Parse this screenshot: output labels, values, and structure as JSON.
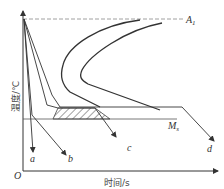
{
  "diagram": {
    "axes": {
      "x_label": "时间/s",
      "y_label": "温度/℃",
      "origin_label": "O"
    },
    "lines": {
      "a1_label": "A",
      "a1_sub": "1",
      "ms_label": "M",
      "ms_sub": "s"
    },
    "curve_labels": [
      "a",
      "b",
      "c",
      "d"
    ],
    "colors": {
      "line": "#333333",
      "dashed": "#888888",
      "hatch": "#444444",
      "background": "#ffffff"
    }
  }
}
